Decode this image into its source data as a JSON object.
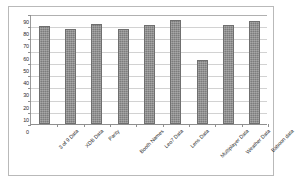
{
  "chart_data": {
    "type": "bar",
    "title": "",
    "subtitle": "",
    "xlabel": "",
    "ylabel": "",
    "categories": [
      "3 of 9 Data",
      "XDB Data",
      "Parity",
      "Booth Names",
      "Leo7 Data",
      "Lens Data",
      "Multiplayer Data",
      "Weather Data",
      "Baboon data"
    ],
    "values": [
      80,
      78,
      82,
      78,
      81,
      85,
      52,
      81,
      84
    ],
    "ylim": [
      0,
      90
    ],
    "ytick_labels": [
      "0",
      "10",
      "20",
      "30",
      "40",
      "50",
      "60",
      "70",
      "80",
      "90"
    ],
    "ytick_values": [
      0,
      10,
      20,
      30,
      40,
      50,
      60,
      70,
      80,
      90
    ],
    "grid": true,
    "grid_axis": "y",
    "legend": false,
    "legend_position": "none",
    "series": [
      {
        "name": "Series 1",
        "values": [
          80,
          78,
          82,
          78,
          81,
          85,
          52,
          81,
          84
        ]
      }
    ]
  },
  "style": {
    "bar_color": "#7c7c7c",
    "bar_border_color": "#6f6f6f",
    "grid_color": "#d2d2d2",
    "axis_color": "#8f8f8f",
    "frame_color": "#b9b9b9",
    "text_color": "#2b2b2b",
    "background": "#ffffff"
  }
}
